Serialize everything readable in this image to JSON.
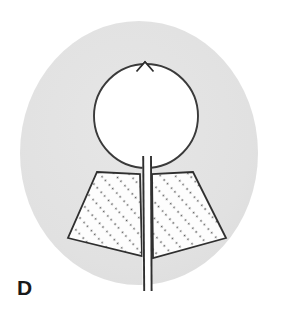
{
  "figure": {
    "panel_label": "D",
    "background_color": "#ffffff",
    "disc": {
      "name": "outer-gray-disc",
      "fill_color": "#e2e2e2",
      "center_x": 139,
      "center_y": 153,
      "radius_x": 119,
      "radius_y": 132
    },
    "inner_circle": {
      "name": "central-white-circle",
      "fill_color": "#ffffff",
      "stroke_color": "#3a3a3a",
      "center_x": 146,
      "center_y": 116,
      "radius": 52,
      "notch": {
        "name": "top-apex-notch",
        "apex_x": 145,
        "apex_y": 62,
        "base_left_x": 138,
        "base_right_x": 152,
        "base_y": 70
      }
    },
    "wings": [
      {
        "name": "left-hatched-wing",
        "fill_color": "#fdfdfd",
        "stroke_color": "#2f2f2f",
        "hatch_color": "#555555",
        "hatch_direction": "diagonal-up-right",
        "points": "97,172 140,174 142,256 68,238"
      },
      {
        "name": "right-hatched-wing",
        "fill_color": "#fdfdfd",
        "stroke_color": "#2f2f2f",
        "hatch_color": "#555555",
        "hatch_direction": "diagonal-up-right",
        "points": "193,172 152,174 153,258 226,238"
      }
    ],
    "channel": {
      "name": "central-vertical-channel",
      "fill_color": "#ffffff",
      "stroke_color": "#2f2f2f",
      "left_x": 142,
      "right_x": 152,
      "top_y": 155,
      "bottom_y": 292
    }
  }
}
